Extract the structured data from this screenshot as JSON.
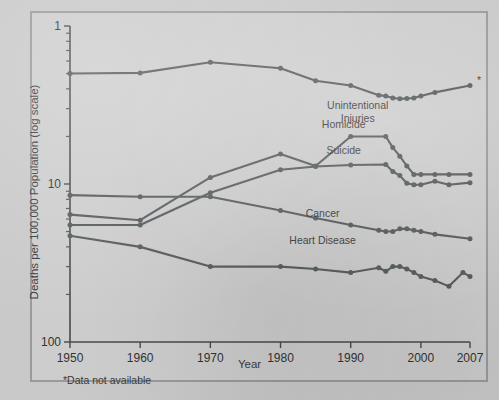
{
  "figure": {
    "background_color": "#c9c9c9",
    "ink_color": "#555a5c",
    "axis_color": "#4a4a4a"
  },
  "axes": {
    "ylabel": "Deaths per 100,000 Population (log scale)",
    "xlabel": "Year",
    "y_tick_labels": [
      "100",
      "10",
      "1"
    ],
    "x_tick_labels": [
      "1950",
      "1960",
      "1970",
      "1980",
      "1990",
      "2000",
      "2007"
    ]
  },
  "footnote": "*Data not available",
  "asterisk": "*",
  "chart_data": {
    "type": "line",
    "title": "",
    "subtitle": "",
    "xlabel": "Year",
    "ylabel": "Deaths per 100,000 Population (log scale)",
    "yscale": "log",
    "ylim": [
      1,
      100
    ],
    "xlim": [
      1950,
      2007
    ],
    "grid": false,
    "legend": "inline-labels",
    "y_ticks": [
      1,
      10,
      100
    ],
    "y_minor_ticks": [
      2,
      3,
      4,
      5,
      6,
      7,
      8,
      9,
      20,
      30,
      40,
      50,
      60,
      70,
      80,
      90
    ],
    "x_ticks": [
      1950,
      1960,
      1970,
      1980,
      1990,
      2000,
      2007
    ],
    "annotations": [
      {
        "text": "*Data not available",
        "position": "below-axis-left"
      },
      {
        "text": "*",
        "position": "last-unintentional-injuries-point"
      }
    ],
    "series": [
      {
        "name": "Unintentional Injuries",
        "label_position": {
          "x": 1991,
          "y": 30
        },
        "x": [
          1950,
          1960,
          1970,
          1980,
          1985,
          1990,
          1994,
          1995,
          1996,
          1997,
          1998,
          1999,
          2000,
          2002,
          2007
        ],
        "values": [
          50.0,
          50.5,
          59.0,
          54.0,
          45.0,
          42.0,
          36.5,
          36.0,
          35.0,
          34.6,
          34.8,
          35.0,
          36.0,
          38.0,
          42.0
        ]
      },
      {
        "name": "Homicide",
        "label_position": {
          "x": 1989,
          "y": 22.5
        },
        "x": [
          1950,
          1960,
          1970,
          1980,
          1985,
          1990,
          1995,
          1996,
          1997,
          1998,
          1999,
          2000,
          2002,
          2004,
          2007
        ],
        "values": [
          6.4,
          5.9,
          11.0,
          15.5,
          13.0,
          20.0,
          20.0,
          17.0,
          15.0,
          13.0,
          11.5,
          11.5,
          11.5,
          11.5,
          11.5
        ]
      },
      {
        "name": "Suicide",
        "label_position": {
          "x": 1989,
          "y": 15.5
        },
        "x": [
          1950,
          1960,
          1970,
          1980,
          1985,
          1990,
          1995,
          1996,
          1997,
          1998,
          1999,
          2000,
          2002,
          2004,
          2007
        ],
        "values": [
          5.5,
          5.5,
          8.8,
          12.3,
          12.9,
          13.2,
          13.3,
          12.0,
          11.3,
          10.1,
          9.9,
          9.9,
          10.4,
          9.9,
          10.2
        ]
      },
      {
        "name": "Cancer",
        "label_position": {
          "x": 1986,
          "y": 6.2
        },
        "x": [
          1950,
          1960,
          1970,
          1980,
          1985,
          1990,
          1994,
          1995,
          1996,
          1997,
          1998,
          1999,
          2000,
          2002,
          2007
        ],
        "values": [
          8.5,
          8.3,
          8.3,
          6.8,
          6.1,
          5.5,
          5.1,
          5.0,
          5.0,
          5.2,
          5.2,
          5.1,
          5.0,
          4.8,
          4.5
        ]
      },
      {
        "name": "Heart Disease",
        "label_position": {
          "x": 1986,
          "y": 4.2
        },
        "x": [
          1950,
          1960,
          1970,
          1980,
          1985,
          1990,
          1994,
          1995,
          1996,
          1997,
          1998,
          1999,
          2000,
          2002,
          2004,
          2006,
          2007
        ],
        "values": [
          4.7,
          4.0,
          3.0,
          3.0,
          2.9,
          2.75,
          2.95,
          2.8,
          3.0,
          3.0,
          2.9,
          2.75,
          2.6,
          2.45,
          2.25,
          2.75,
          2.6
        ]
      }
    ]
  }
}
